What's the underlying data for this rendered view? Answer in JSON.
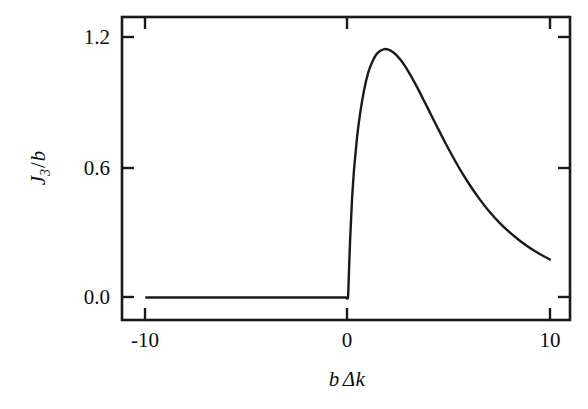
{
  "figure": {
    "background_color": "#ffffff",
    "line_color": "#1a1a1a",
    "axis_color": "#1a1a1a"
  },
  "axes": {
    "y_label_parts": {
      "symbol": "J",
      "subscript": "3",
      "slash": "/",
      "denominator": "b"
    },
    "x_label_parts": {
      "symbol": "b",
      "delta": "Δ",
      "variable": "k"
    },
    "y_ticks": [
      {
        "value": 0.0,
        "label": "0.0"
      },
      {
        "value": 0.6,
        "label": "0.6"
      },
      {
        "value": 1.2,
        "label": "1.2"
      }
    ],
    "x_ticks": [
      {
        "value": -10,
        "label": "-10"
      },
      {
        "value": 0,
        "label": "0"
      },
      {
        "value": 10,
        "label": "10"
      }
    ]
  },
  "chart_data": {
    "type": "line",
    "title": "",
    "subtitle": "",
    "xlabel": "b Δk",
    "ylabel": "J_3 / b",
    "xlim": [
      -11.2,
      11.0
    ],
    "ylim": [
      -0.105,
      1.31
    ],
    "grid": false,
    "legend": null,
    "annotations": [],
    "series": [
      {
        "name": "J3/b",
        "color": "#1a1a1a",
        "x": [
          -10.0,
          -9.0,
          -8.0,
          -7.0,
          -6.0,
          -5.0,
          -4.0,
          -3.0,
          -2.0,
          -1.0,
          -0.4,
          -0.1,
          0.0,
          0.05,
          0.1,
          0.2,
          0.3,
          0.45,
          0.6,
          0.8,
          1.0,
          1.2,
          1.4,
          1.6,
          1.8,
          2.0,
          2.2,
          2.4,
          2.6,
          2.8,
          3.0,
          3.3,
          3.6,
          4.0,
          4.4,
          4.8,
          5.2,
          5.6,
          6.0,
          6.5,
          7.0,
          7.5,
          8.0,
          8.5,
          9.0,
          9.5,
          10.0
        ],
        "y": [
          0.0,
          0.0,
          0.0,
          0.0,
          0.0,
          0.0,
          0.0,
          0.0,
          0.0,
          0.0,
          0.0,
          0.0,
          0.0,
          0.13,
          0.26,
          0.46,
          0.6,
          0.75,
          0.86,
          0.97,
          1.05,
          1.1,
          1.135,
          1.152,
          1.16,
          1.158,
          1.148,
          1.132,
          1.11,
          1.084,
          1.054,
          1.004,
          0.95,
          0.875,
          0.8,
          0.726,
          0.656,
          0.59,
          0.53,
          0.462,
          0.402,
          0.35,
          0.305,
          0.266,
          0.232,
          0.203,
          0.178
        ]
      }
    ]
  }
}
